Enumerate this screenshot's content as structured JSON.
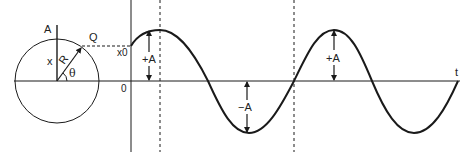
{
  "diagram": {
    "circle": {
      "labels": {
        "top_point": "A",
        "moving_point": "Q",
        "displacement": "x",
        "radius": "R",
        "angle": "θ"
      }
    },
    "graph": {
      "labels": {
        "initial_displacement": "x0",
        "origin": "0",
        "time_axis": "t",
        "positive_amplitude_1": "+A",
        "negative_amplitude": "−A",
        "positive_amplitude_2": "+A"
      }
    },
    "colors": {
      "stroke": "#1a1a1a",
      "background": "#ffffff"
    }
  }
}
